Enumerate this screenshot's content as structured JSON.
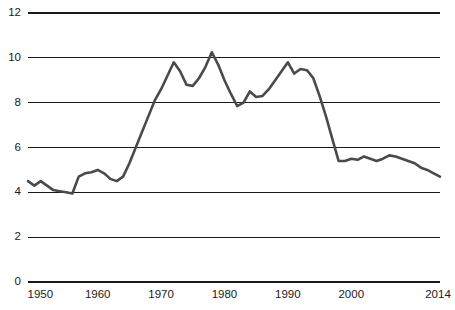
{
  "chart_data": {
    "type": "line",
    "title": "",
    "subtitle": "",
    "xlabel": "",
    "ylabel": "",
    "xlim": [
      1949,
      2014
    ],
    "ylim": [
      0,
      12
    ],
    "grid": true,
    "legend": null,
    "legend_position": "none",
    "line_color": "#4a4a4a",
    "axis_color": "#1a1a1a",
    "y_ticks": [
      0,
      2,
      4,
      6,
      8,
      10,
      12
    ],
    "y_tick_labels": [
      "0",
      "2",
      "4",
      "6",
      "8",
      "10",
      "12"
    ],
    "x_ticks": [
      1950,
      1960,
      1970,
      1980,
      1990,
      2000,
      2014
    ],
    "x_tick_labels": [
      "1950",
      "1960",
      "1970",
      "1980",
      "1990",
      "2000",
      "2014"
    ],
    "series": [
      {
        "name": "",
        "x": [
          1949,
          1950,
          1951,
          1952,
          1953,
          1954,
          1955,
          1956,
          1957,
          1958,
          1959,
          1960,
          1961,
          1962,
          1963,
          1964,
          1965,
          1966,
          1967,
          1968,
          1969,
          1970,
          1971,
          1972,
          1973,
          1974,
          1975,
          1976,
          1977,
          1978,
          1979,
          1980,
          1981,
          1982,
          1983,
          1984,
          1985,
          1986,
          1987,
          1988,
          1989,
          1990,
          1991,
          1992,
          1993,
          1994,
          1995,
          1996,
          1997,
          1998,
          1999,
          2000,
          2001,
          2002,
          2003,
          2004,
          2005,
          2006,
          2007,
          2008,
          2009,
          2010,
          2011,
          2012,
          2013,
          2014
        ],
        "values": [
          4.5,
          4.3,
          4.5,
          4.3,
          4.1,
          4.05,
          4.0,
          3.95,
          4.7,
          4.85,
          4.9,
          5.0,
          4.85,
          4.6,
          4.5,
          4.7,
          5.3,
          6.0,
          6.7,
          7.4,
          8.1,
          8.6,
          9.2,
          9.8,
          9.4,
          8.8,
          8.75,
          9.1,
          9.6,
          10.25,
          9.7,
          9.0,
          8.4,
          7.85,
          8.0,
          8.5,
          8.25,
          8.3,
          8.6,
          9.0,
          9.4,
          9.8,
          9.3,
          9.5,
          9.45,
          9.1,
          8.3,
          7.4,
          6.4,
          5.4,
          5.4,
          5.5,
          5.45,
          5.6,
          5.5,
          5.4,
          5.5,
          5.65,
          5.6,
          5.5,
          5.4,
          5.3,
          5.1,
          5.0,
          4.85,
          4.7
        ]
      }
    ]
  },
  "axes": {
    "y_axis_name": "y-axis",
    "x_axis_name": "x-axis"
  }
}
